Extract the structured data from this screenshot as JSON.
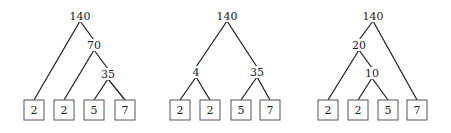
{
  "diagram": {
    "title": "",
    "colors": {
      "edge": "#1a1a1a",
      "box_stroke": "#555555",
      "text": "#222222",
      "background": "#ffffff"
    },
    "trees": [
      {
        "name": "tree-left-deep",
        "internal_nodes": [
          {
            "id": "a",
            "label": "140",
            "x": 80,
            "y": 16
          },
          {
            "id": "b",
            "label": "70",
            "x": 94,
            "y": 45
          },
          {
            "id": "c",
            "label": "35",
            "x": 108,
            "y": 74
          }
        ],
        "leaves": [
          {
            "id": "l1",
            "label": "2",
            "x": 34,
            "y": 110
          },
          {
            "id": "l2",
            "label": "2",
            "x": 64,
            "y": 110
          },
          {
            "id": "l3",
            "label": "5",
            "x": 94,
            "y": 110
          },
          {
            "id": "l4",
            "label": "7",
            "x": 125,
            "y": 110
          }
        ],
        "edges": [
          [
            "a",
            "l1"
          ],
          [
            "a",
            "b"
          ],
          [
            "b",
            "l2"
          ],
          [
            "b",
            "c"
          ],
          [
            "c",
            "l3"
          ],
          [
            "c",
            "l4"
          ]
        ]
      },
      {
        "name": "tree-balanced",
        "internal_nodes": [
          {
            "id": "a",
            "label": "140",
            "x": 227,
            "y": 16
          },
          {
            "id": "b",
            "label": "4",
            "x": 196,
            "y": 72
          },
          {
            "id": "c",
            "label": "35",
            "x": 257,
            "y": 72
          }
        ],
        "leaves": [
          {
            "id": "l1",
            "label": "2",
            "x": 180,
            "y": 110
          },
          {
            "id": "l2",
            "label": "2",
            "x": 210,
            "y": 110
          },
          {
            "id": "l3",
            "label": "5",
            "x": 241,
            "y": 110
          },
          {
            "id": "l4",
            "label": "7",
            "x": 270,
            "y": 110
          }
        ],
        "edges": [
          [
            "a",
            "b"
          ],
          [
            "a",
            "c"
          ],
          [
            "b",
            "l1"
          ],
          [
            "b",
            "l2"
          ],
          [
            "c",
            "l3"
          ],
          [
            "c",
            "l4"
          ]
        ]
      },
      {
        "name": "tree-right-heavy",
        "internal_nodes": [
          {
            "id": "a",
            "label": "140",
            "x": 373,
            "y": 16
          },
          {
            "id": "b",
            "label": "20",
            "x": 359,
            "y": 45
          },
          {
            "id": "c",
            "label": "10",
            "x": 372,
            "y": 73
          }
        ],
        "leaves": [
          {
            "id": "l1",
            "label": "2",
            "x": 328,
            "y": 110
          },
          {
            "id": "l2",
            "label": "2",
            "x": 358,
            "y": 110
          },
          {
            "id": "l3",
            "label": "5",
            "x": 388,
            "y": 110
          },
          {
            "id": "l4",
            "label": "7",
            "x": 417,
            "y": 110
          }
        ],
        "edges": [
          [
            "a",
            "b"
          ],
          [
            "a",
            "l4"
          ],
          [
            "b",
            "l1"
          ],
          [
            "b",
            "c"
          ],
          [
            "c",
            "l2"
          ],
          [
            "c",
            "l3"
          ]
        ]
      }
    ],
    "leaf_box_size": 20
  }
}
